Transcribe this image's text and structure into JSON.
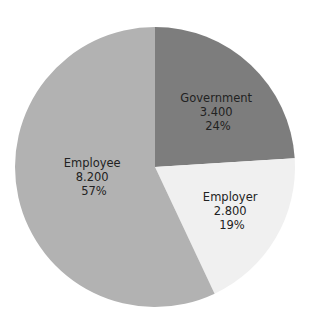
{
  "chart_data": {
    "type": "pie",
    "title": "",
    "start_angle_deg": 0,
    "direction": "clockwise",
    "slices": [
      {
        "label": "Government",
        "value": 3.4,
        "value_text": "3.400",
        "percent": 24,
        "percent_text": "24%",
        "color": "#7d7d7d"
      },
      {
        "label": "Employer",
        "value": 2.8,
        "value_text": "2.800",
        "percent": 19,
        "percent_text": "19%",
        "color": "#f0f0f0"
      },
      {
        "label": "Employee",
        "value": 8.2,
        "value_text": "8.200",
        "percent": 57,
        "percent_text": "57%",
        "color": "#b2b2b2"
      }
    ],
    "categories": [
      "Government",
      "Employer",
      "Employee"
    ],
    "values": [
      3.4,
      2.8,
      8.2
    ],
    "legend": "none (labels inside slices)"
  }
}
